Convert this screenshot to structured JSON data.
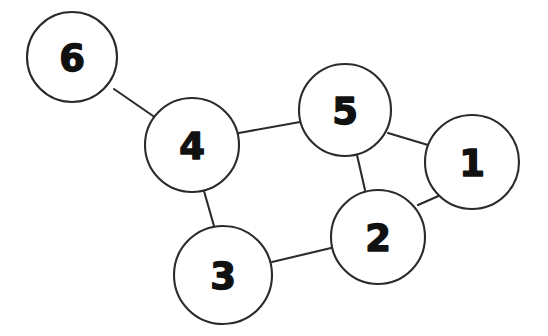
{
  "diagram": {
    "style": "hand-drawn",
    "background_color": "#ffffff",
    "stroke_color": "#2b2b2b",
    "label_color": "#111111",
    "width": 548,
    "height": 336
  },
  "nodes": [
    {
      "id": "6",
      "label": "6",
      "cx": 72,
      "cy": 57,
      "r": 45
    },
    {
      "id": "4",
      "label": "4",
      "cx": 192,
      "cy": 145,
      "r": 47
    },
    {
      "id": "5",
      "label": "5",
      "cx": 345,
      "cy": 110,
      "r": 46
    },
    {
      "id": "1",
      "label": "1",
      "cx": 472,
      "cy": 162,
      "r": 47
    },
    {
      "id": "2",
      "label": "2",
      "cx": 378,
      "cy": 237,
      "r": 47
    },
    {
      "id": "3",
      "label": "3",
      "cx": 223,
      "cy": 275,
      "r": 49
    }
  ],
  "edges": [
    {
      "id": "edge-6-4",
      "from": "6",
      "to": "4",
      "x1": 114,
      "y1": 89,
      "x2": 156,
      "y2": 118
    },
    {
      "id": "edge-4-5",
      "from": "4",
      "to": "5",
      "x1": 239,
      "y1": 133,
      "x2": 300,
      "y2": 122
    },
    {
      "id": "edge-4-3",
      "from": "4",
      "to": "3",
      "x1": 204,
      "y1": 191,
      "x2": 214,
      "y2": 226
    },
    {
      "id": "edge-5-1",
      "from": "5",
      "to": "1",
      "x1": 388,
      "y1": 133,
      "x2": 428,
      "y2": 145
    },
    {
      "id": "edge-5-2",
      "from": "5",
      "to": "2",
      "x1": 357,
      "y1": 155,
      "x2": 365,
      "y2": 190
    },
    {
      "id": "edge-2-1",
      "from": "2",
      "to": "1",
      "x1": 418,
      "y1": 205,
      "x2": 443,
      "y2": 194
    },
    {
      "id": "edge-2-3",
      "from": "2",
      "to": "3",
      "x1": 331,
      "y1": 248,
      "x2": 272,
      "y2": 262
    }
  ]
}
